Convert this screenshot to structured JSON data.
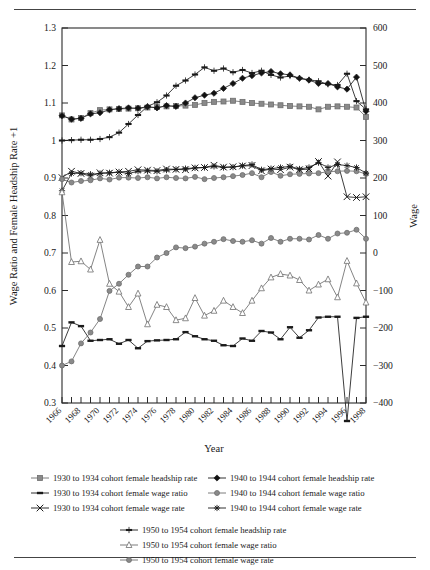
{
  "figure": {
    "type": "line-chart-figure",
    "top_rule": true,
    "bottom_rule": true
  },
  "chart_data": {
    "type": "line",
    "title": "",
    "xlabel": "Year",
    "ylabel": "Wage Ratio and Female Headship Rate +1",
    "y2label": "Wage",
    "grid": false,
    "legend_position": "below",
    "xlim": [
      1966,
      1998
    ],
    "ylim": [
      0.3,
      1.3
    ],
    "y2lim": [
      -400,
      600
    ],
    "yticks": [
      0.3,
      0.4,
      0.5,
      0.6,
      0.7,
      0.8,
      0.9,
      1,
      1.1,
      1.2,
      1.3
    ],
    "ytick_labels": [
      "0.3",
      "0.4",
      "0.5",
      "0.6",
      "0.7",
      "0.8",
      "0.9",
      "1",
      "1.1",
      "1.2",
      "1.3"
    ],
    "y2ticks": [
      -400,
      -300,
      -200,
      -100,
      0,
      100,
      200,
      300,
      400,
      500,
      600
    ],
    "y2tick_labels": [
      "−400",
      "−300",
      "−200",
      "−100",
      "0",
      "100",
      "200",
      "300",
      "400",
      "500",
      "600"
    ],
    "x": [
      1966,
      1967,
      1968,
      1969,
      1970,
      1971,
      1972,
      1973,
      1974,
      1975,
      1976,
      1977,
      1978,
      1979,
      1980,
      1981,
      1982,
      1983,
      1984,
      1985,
      1986,
      1987,
      1988,
      1989,
      1990,
      1991,
      1992,
      1993,
      1994,
      1995,
      1996,
      1997,
      1998
    ],
    "xtick_labels": [
      "1966",
      "1968",
      "1970",
      "1972",
      "1974",
      "1976",
      "1978",
      "1980",
      "1982",
      "1984",
      "1986",
      "1988",
      "1990",
      "1992",
      "1994",
      "1996",
      "1998"
    ],
    "xtick_label_years": [
      1966,
      1968,
      1970,
      1972,
      1974,
      1976,
      1978,
      1980,
      1982,
      1984,
      1986,
      1988,
      1990,
      1992,
      1994,
      1996,
      1998
    ],
    "series": [
      {
        "name": "1930 to 1934 cohort female headship rate",
        "key": "h3034",
        "axis": "left",
        "marker": "square",
        "marker_fill": "#8a8a8a",
        "color": "#6e6e6e",
        "values": [
          1.067,
          1.056,
          1.06,
          1.073,
          1.081,
          1.083,
          1.084,
          1.085,
          1.086,
          1.088,
          1.089,
          1.091,
          1.092,
          1.093,
          1.095,
          1.1,
          1.103,
          1.104,
          1.106,
          1.103,
          1.1,
          1.098,
          1.096,
          1.094,
          1.092,
          1.091,
          1.09,
          1.083,
          1.09,
          1.091,
          1.09,
          1.088,
          1.063
        ]
      },
      {
        "name": "1930 to 1934 cohort female wage ratio",
        "key": "w3034",
        "axis": "left",
        "marker": "dash",
        "marker_fill": "#1a1a1a",
        "color": "#1a1a1a",
        "values": [
          0.452,
          0.515,
          0.505,
          0.466,
          0.468,
          0.47,
          0.458,
          0.468,
          0.446,
          0.465,
          0.467,
          0.468,
          0.47,
          0.489,
          0.478,
          0.47,
          0.466,
          0.454,
          0.452,
          0.472,
          0.466,
          0.492,
          0.488,
          0.47,
          0.502,
          0.474,
          0.494,
          0.528,
          0.53,
          0.53,
          0.252,
          0.527,
          0.53
        ]
      },
      {
        "name": "1930 to 1934 cohort female wage rate",
        "key": "r3034",
        "axis": "right",
        "marker": "cross",
        "marker_fill": "#1a1a1a",
        "color": "#1a1a1a",
        "values": [
          201,
          218,
          212,
          205,
          214,
          213,
          216,
          218,
          222,
          221,
          220,
          224,
          223,
          222,
          227,
          228,
          234,
          229,
          230,
          232,
          233,
          219,
          224,
          222,
          229,
          222,
          224,
          244,
          205,
          243,
          150,
          148,
          150
        ]
      },
      {
        "name": "1940 to 1944 cohort female headship rate",
        "key": "h4044",
        "axis": "left",
        "marker": "diamond",
        "marker_fill": "#111111",
        "color": "#1a1a1a",
        "values": [
          1.066,
          1.057,
          1.059,
          1.071,
          1.074,
          1.082,
          1.085,
          1.087,
          1.086,
          1.09,
          1.087,
          1.093,
          1.091,
          1.1,
          1.114,
          1.121,
          1.126,
          1.139,
          1.152,
          1.166,
          1.173,
          1.18,
          1.184,
          1.178,
          1.175,
          1.166,
          1.161,
          1.152,
          1.152,
          1.143,
          1.137,
          1.169,
          1.078
        ]
      },
      {
        "name": "1940 to 1944 cohort female wage ratio",
        "key": "w4044",
        "axis": "left",
        "marker": "circle",
        "marker_fill": "#8a8a8a",
        "color": "#6e6e6e",
        "values": [
          0.897,
          0.888,
          0.892,
          0.894,
          0.899,
          0.896,
          0.901,
          0.901,
          0.9,
          0.902,
          0.899,
          0.902,
          0.9,
          0.899,
          0.903,
          0.897,
          0.9,
          0.902,
          0.905,
          0.908,
          0.913,
          0.902,
          0.916,
          0.906,
          0.91,
          0.911,
          0.912,
          0.913,
          0.917,
          0.918,
          0.919,
          0.918,
          0.911
        ]
      },
      {
        "name": "1940 to 1944 cohort female wage rate",
        "key": "r4044",
        "axis": "right",
        "marker": "star",
        "marker_fill": "#1a1a1a",
        "color": "#1a1a1a",
        "values": [
          166,
          212,
          213,
          210,
          212,
          214,
          216,
          212,
          218,
          219,
          218,
          221,
          223,
          225,
          227,
          228,
          231,
          228,
          229,
          233,
          236,
          222,
          225,
          228,
          231,
          224,
          228,
          241,
          228,
          236,
          233,
          228,
          213
        ]
      },
      {
        "name": "1950 to 1954 cohort female headship rate",
        "key": "h5054",
        "axis": "left",
        "marker": "bar",
        "marker_fill": "#1a1a1a",
        "color": "#1a1a1a",
        "values": [
          1.0,
          1.001,
          1.002,
          1.002,
          1.004,
          1.009,
          1.021,
          1.044,
          1.068,
          1.091,
          1.102,
          1.12,
          1.146,
          1.16,
          1.176,
          1.195,
          1.186,
          1.192,
          1.182,
          1.188,
          1.18,
          1.186,
          1.175,
          1.168,
          1.172,
          1.166,
          1.162,
          1.158,
          1.15,
          1.148,
          1.178,
          1.105,
          1.083
        ]
      },
      {
        "name": "1950 to 1954 cohort female wage ratio",
        "key": "w5054",
        "axis": "left",
        "marker": "triangle",
        "marker_fill": "#ffffff",
        "color": "#6e6e6e",
        "values": [
          0.862,
          0.676,
          0.678,
          0.656,
          0.735,
          0.618,
          0.597,
          0.556,
          0.592,
          0.51,
          0.562,
          0.556,
          0.521,
          0.526,
          0.58,
          0.533,
          0.546,
          0.573,
          0.556,
          0.54,
          0.573,
          0.606,
          0.635,
          0.644,
          0.64,
          0.628,
          0.6,
          0.616,
          0.63,
          0.582,
          0.679,
          0.619,
          0.568
        ]
      },
      {
        "name": "1950 to 1954 cohort female wage rate",
        "key": "r5054",
        "axis": "right",
        "marker": "circle",
        "marker_fill": "#8a8a8a",
        "color": "#6e6e6e",
        "values": [
          -300,
          -289,
          -241,
          -212,
          -176,
          -101,
          -82,
          -58,
          -36,
          -36,
          -12,
          0,
          15,
          13,
          17,
          25,
          30,
          37,
          32,
          30,
          34,
          25,
          40,
          30,
          38,
          38,
          36,
          48,
          38,
          52,
          54,
          62,
          38
        ]
      }
    ]
  },
  "legend": {
    "rows": [
      {
        "left": {
          "label": "1930 to 1934 cohort female headship rate",
          "key": "h3034"
        },
        "right": {
          "label": "1940 to 1944 cohort female headship rate",
          "key": "h4044"
        }
      },
      {
        "left": {
          "label": "1930 to 1934 cohort female wage ratio",
          "key": "w3034"
        },
        "right": {
          "label": "1940 to 1944 cohort female wage ratio",
          "key": "w4044"
        }
      },
      {
        "left": {
          "label": "1930 to 1934 cohort female wage rate",
          "key": "r3034"
        },
        "right": {
          "label": "1940 to 1944 cohort female wage rate",
          "key": "r4044"
        }
      }
    ],
    "center_rows": [
      {
        "label": "1950 to 1954 cohort female headship rate",
        "key": "h5054"
      },
      {
        "label": "1950 to 1954 cohort female wage ratio",
        "key": "w5054"
      },
      {
        "label": "1950 to 1954 cohort female wage rate",
        "key": "r5054"
      }
    ]
  }
}
